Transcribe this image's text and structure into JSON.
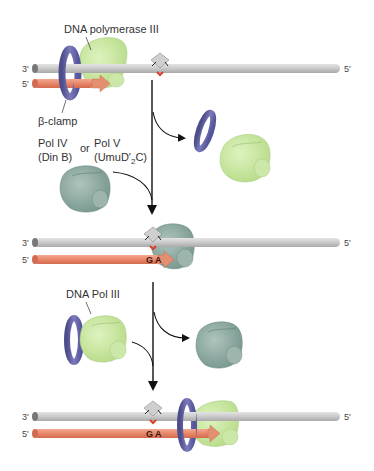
{
  "colors": {
    "template_strand": "#c8c8c8",
    "template_strand_end": "#7a7a7a",
    "primer_strand": "#e8866a",
    "primer_arrow": "#e58f72",
    "beta_clamp": "#6a6aa8",
    "pol_iii": "#c6e6a0",
    "pol_iv_v": "#8faaa2",
    "lesion": "#cfcfcf",
    "lesion_mark": "#d9402a",
    "arrow": "#111111"
  },
  "panels": [
    {
      "id": "stalled",
      "strand_labels": {
        "template_left": "3'",
        "template_right": "5'",
        "primer_left": "5'"
      },
      "labels": {
        "polymerase": "DNA polymerase III",
        "clamp": "β-clamp"
      }
    },
    {
      "id": "switch",
      "labels": {
        "pol_iv": "Pol IV",
        "pol_iv_gene": "(Din B)",
        "or": "or",
        "pol_v": "Pol V",
        "pol_v_gene_pre": "(UmuD'",
        "pol_v_gene_sub": "2",
        "pol_v_gene_post": "C)"
      }
    },
    {
      "id": "bypass",
      "strand_labels": {
        "template_left": "3'",
        "template_right": "5'",
        "primer_left": "5'"
      },
      "bases": [
        "G",
        "A"
      ]
    },
    {
      "id": "restart",
      "labels": {
        "polymerase": "DNA Pol III"
      }
    },
    {
      "id": "resumed",
      "strand_labels": {
        "template_left": "3'",
        "template_right": "5'",
        "primer_left": "5'"
      },
      "bases": [
        "G",
        "A"
      ]
    }
  ]
}
